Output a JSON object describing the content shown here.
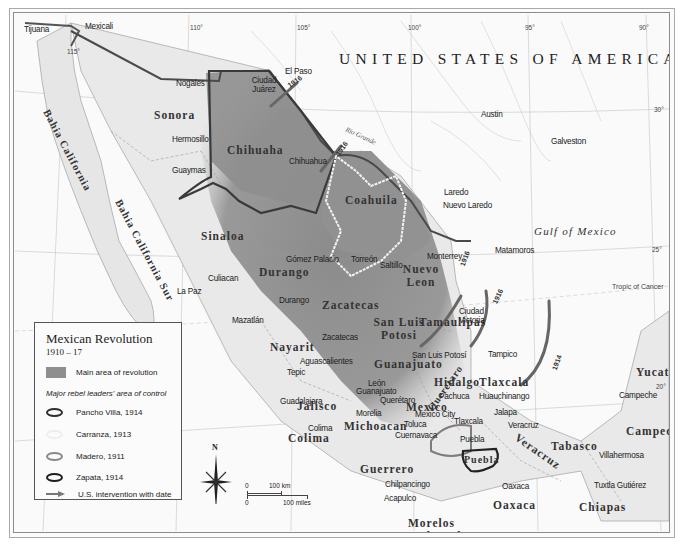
{
  "map": {
    "title": "Mexican Revolution",
    "subtitle": "1910 – 17",
    "country_label": "UNITED STATES OF AMERICA",
    "seas": [
      {
        "name": "Gulf of Mexico"
      }
    ],
    "rivers": [
      {
        "name": "Rio Grande"
      }
    ],
    "lines": {
      "tropic": "Tropic of Cancer"
    },
    "longitude_ticks": [
      "115°",
      "110°",
      "105°",
      "100°",
      "95°",
      "90°"
    ],
    "latitude_ticks": [
      "30°",
      "25°",
      "20°"
    ],
    "states": [
      "Sonora",
      "Chihuaha",
      "Coahuila",
      "Nuevo Leon",
      "Sinaloa",
      "Durango",
      "Zacatecas",
      "San Luis Potosi",
      "Tamaulipas",
      "Nayarit",
      "Jalisco",
      "Guanajuato",
      "Queretaro",
      "Hidalgo",
      "Tlaxcala",
      "Mexico",
      "Michoacan",
      "Colima",
      "Guerrero",
      "Morelos",
      "Tlaxcala",
      "Puebla",
      "Veracruz",
      "Oaxaca",
      "Tabasco",
      "Chiapas",
      "Campeche",
      "Yucatan",
      "Bahia California",
      "Bahia California Sur"
    ],
    "cities": [
      "Tijuana",
      "Mexicali",
      "Nogales",
      "El Paso",
      "Ciudad Juárez",
      "Hermosillo",
      "Guaymas",
      "Chihuahua",
      "Austin",
      "Galveston",
      "Laredo",
      "Nuevo Laredo",
      "Matamoros",
      "Monterrey",
      "Saltillo",
      "Gómez Palacio",
      "Torreón",
      "Culiacan",
      "La Paz",
      "Durango",
      "Mazatlán",
      "Ciudad Victoria",
      "Zacatecas",
      "Aguascalientes",
      "San Luis Potosí",
      "Tampico",
      "Tepic",
      "León",
      "Guanajuato",
      "Querétaro",
      "Pachuca",
      "Huauchinango",
      "Guadalajara",
      "Morelia",
      "Mexico City",
      "Toluca",
      "Tlaxcala",
      "Jalapa",
      "Veracruz",
      "Colima",
      "Cuernavaca",
      "Puebla",
      "Chilpancingo",
      "Acapulco",
      "Oaxaca",
      "Campeche",
      "Villahermosa",
      "Tuxtla Gutiérez"
    ],
    "intervention_dates": [
      "1916",
      "1916",
      "1916",
      "1916",
      "1914"
    ],
    "scale": {
      "km": "100 km",
      "miles": "100 miles",
      "zero": "0"
    },
    "compass": "N"
  },
  "legend": {
    "title": "Mexican Revolution",
    "subtitle": "1910 – 17",
    "main_area": "Main area of revolution",
    "leaders_heading": "Major rebel leaders' area of control",
    "items": [
      {
        "label": "Pancho Villa, 1914",
        "color": "#3a3a3a"
      },
      {
        "label": "Carranza, 1913",
        "color": "#efefef"
      },
      {
        "label": "Madero, 1911",
        "color": "#8a8a8a"
      },
      {
        "label": "Zapata, 1914",
        "color": "#1f1f1f"
      }
    ],
    "intervention": "U.S. intervention with date"
  },
  "colors": {
    "revolution_area": "#8e8e8e",
    "land": "#e9e9e9",
    "water": "#f9f9f9",
    "border": "#4a4a4a"
  }
}
